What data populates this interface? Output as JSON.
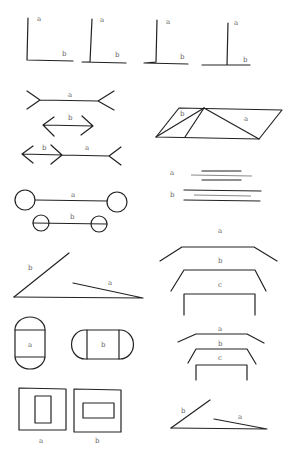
{
  "figure": {
    "width": 297,
    "height": 453,
    "stroke_color": "#222222",
    "light_stroke_color": "#888888",
    "label_color": "#666666",
    "panels": [
      {
        "id": "vertical-horizontal-illusion",
        "paths": [
          "M28 18 L27 60 L73 61",
          "M92 19 L90 62 L82 62 M82 62 L126 63",
          "M157 20 L156 62 L144 63 M144 63 L188 64",
          "M228 23 L227 65 L202 65 M202 65 L250 65"
        ],
        "labels": [
          {
            "text": "a",
            "x": 37,
            "y": 21
          },
          {
            "text": "b",
            "x": 62,
            "y": 56
          },
          {
            "text": "a",
            "x": 100,
            "y": 22
          },
          {
            "text": "b",
            "x": 115,
            "y": 57
          },
          {
            "text": "a",
            "x": 166,
            "y": 24
          },
          {
            "text": "b",
            "x": 180,
            "y": 59
          },
          {
            "text": "a",
            "x": 234,
            "y": 25
          },
          {
            "text": "b",
            "x": 243,
            "y": 62
          }
        ]
      },
      {
        "id": "muller-lyer-illusion",
        "paths": [
          "M27 91 L40 100 L27 109 M40 100 L98 101 L114 91 M98 101 L114 110",
          "M54 117 L43 125 L54 136 M43 125 L93 126 M82 116 L93 126 L81 135",
          "M33 146 L22 154 L33 163 M22 154 L62 155 M51 145 L62 155 L51 164 M62 155 L109 156 L121 147 M109 156 L121 165"
        ],
        "labels": [
          {
            "text": "a",
            "x": 68,
            "y": 97
          },
          {
            "text": "b",
            "x": 68,
            "y": 120
          },
          {
            "text": "b",
            "x": 42,
            "y": 150
          },
          {
            "text": "a",
            "x": 85,
            "y": 150
          }
        ]
      },
      {
        "id": "sander-parallelogram",
        "paths": [
          "M179 108 L282 110 L259 139 L156 137 Z",
          "M204 108 L185 137",
          "M204 108 L156 137",
          "M204 108 L259 139"
        ],
        "labels": [
          {
            "text": "b",
            "x": 180,
            "y": 116
          },
          {
            "text": "a",
            "x": 244,
            "y": 121
          }
        ]
      },
      {
        "id": "dumbbell-circles",
        "circles": [
          {
            "cx": 25,
            "cy": 200,
            "r": 10
          },
          {
            "cx": 117,
            "cy": 202,
            "r": 10
          },
          {
            "cx": 41,
            "cy": 223,
            "r": 8
          },
          {
            "cx": 99,
            "cy": 224,
            "r": 8
          }
        ],
        "paths": [
          "M35 200 L107 201",
          "M33 223 L107 224"
        ],
        "labels": [
          {
            "text": "a",
            "x": 71,
            "y": 197
          },
          {
            "text": "b",
            "x": 70,
            "y": 219
          }
        ]
      },
      {
        "id": "parallel-lines-illusion",
        "paths": [
          "M202 171 L241 171",
          "M202 180 L241 180",
          "M184 190 L261 191",
          "M184 200 L260 201"
        ],
        "light_paths": [
          "M191 175 L252 176",
          "M194 195 L251 196"
        ],
        "labels": [
          {
            "text": "a",
            "x": 170,
            "y": 175
          },
          {
            "text": "b",
            "x": 170,
            "y": 197
          }
        ]
      },
      {
        "id": "ponzo-angle",
        "paths": [
          "M14 297 L69 253",
          "M14 297 L143 298 L73 283"
        ],
        "labels": [
          {
            "text": "b",
            "x": 28,
            "y": 270
          },
          {
            "text": "a",
            "x": 108,
            "y": 285
          }
        ]
      },
      {
        "id": "trapezoid-size-illusion",
        "paths": [
          "M160 261 L182 247 L254 247 L277 261",
          "M171 291 L184 270 L255 270 L266 291",
          "M184 315 L184 294 L255 294 L255 315"
        ],
        "labels": [
          {
            "text": "a",
            "x": 218,
            "y": 233
          },
          {
            "text": "b",
            "x": 218,
            "y": 263
          },
          {
            "text": "c",
            "x": 218,
            "y": 287
          }
        ]
      },
      {
        "id": "capsule-shapes",
        "paths": [
          "M15 330 A15 13 0 0 1 45 330 L45 356 A15 13 0 0 1 15 356 Z",
          "M15 330 L45 330",
          "M15 357 L45 357",
          "M85 330 L120 330 A13 14 0 0 1 120 359 L85 359 A13 14 0 0 1 85 330 Z",
          "M87 330 L87 359",
          "M119 330 L119 359"
        ],
        "labels": [
          {
            "text": "a",
            "x": 28,
            "y": 347
          },
          {
            "text": "b",
            "x": 101,
            "y": 347
          }
        ]
      },
      {
        "id": "trapezoid-size-illusion-small",
        "paths": [
          "M178 342 L196 334 L247 334 L264 343",
          "M188 363 L196 349 L247 349 L256 364",
          "M196 380 L196 365 L247 365 L247 380"
        ],
        "labels": [
          {
            "text": "a",
            "x": 218,
            "y": 331
          },
          {
            "text": "b",
            "x": 218,
            "y": 346
          },
          {
            "text": "c",
            "x": 218,
            "y": 360
          }
        ]
      },
      {
        "id": "framed-rectangles",
        "paths": [
          "M19 388 L66 389 L66 430 L19 430 Z",
          "M35 396 L51 396 L51 423 L35 423 Z",
          "M74 389 L121 390 L121 432 L74 432 Z",
          "M83 403 L114 403 L114 418 L83 418 Z"
        ],
        "labels": [
          {
            "text": "a",
            "x": 39,
            "y": 443
          },
          {
            "text": "b",
            "x": 95,
            "y": 443
          }
        ]
      },
      {
        "id": "ponzo-angle-small",
        "paths": [
          "M171 428 L210 400",
          "M171 428 L267 429 L214 419"
        ],
        "labels": [
          {
            "text": "b",
            "x": 181,
            "y": 413
          },
          {
            "text": "a",
            "x": 238,
            "y": 419
          }
        ]
      }
    ]
  }
}
